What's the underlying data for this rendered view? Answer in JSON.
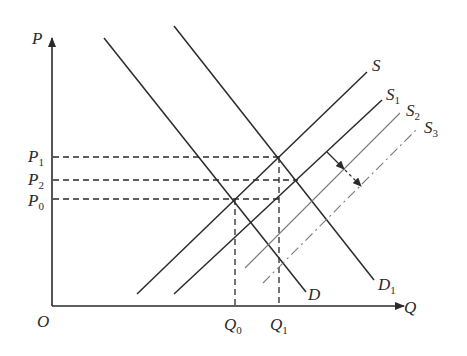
{
  "diagram": {
    "type": "supply-demand",
    "axes": {
      "y_label": "P",
      "x_label": "Q",
      "origin_label": "O"
    },
    "price_levels": [
      {
        "id": "P1",
        "base": "P",
        "sub": "1"
      },
      {
        "id": "P2",
        "base": "P",
        "sub": "2"
      },
      {
        "id": "P0",
        "base": "P",
        "sub": "0"
      }
    ],
    "quantity_levels": [
      {
        "id": "Q0",
        "base": "Q",
        "sub": "0"
      },
      {
        "id": "Q1",
        "base": "Q",
        "sub": "1"
      }
    ],
    "curves": {
      "D": {
        "base": "D",
        "sub": "",
        "style": "solid"
      },
      "D1": {
        "base": "D",
        "sub": "1",
        "style": "solid"
      },
      "S": {
        "base": "S",
        "sub": "",
        "style": "solid"
      },
      "S1": {
        "base": "S",
        "sub": "1",
        "style": "solid"
      },
      "S2": {
        "base": "S",
        "sub": "2",
        "style": "thin-gray"
      },
      "S3": {
        "base": "S",
        "sub": "3",
        "style": "dash-dot"
      }
    },
    "annotation": "arrow indicating rightward shift of supply from S1 toward S2 and S3",
    "colors": {
      "line": "#2a2a2a",
      "gray_line": "#7a7a7a"
    }
  }
}
